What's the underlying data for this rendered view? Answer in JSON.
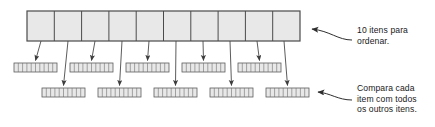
{
  "figure": {
    "title_alt": "Diagrama de ordenacao por comparacao",
    "background_color": "#ffffff",
    "cell_fill": "#e8e8e8",
    "cell_stroke": "#585858",
    "main_bar_stroke": "#404040",
    "arrow_color": "#4a4a4a",
    "text_color": "#1a1a1a"
  },
  "annotations": {
    "top": {
      "lines": [
        "10 itens para",
        "ordenar."
      ],
      "text": "10 itens para ordenar."
    },
    "bottom": {
      "lines": [
        "Compara cada",
        "item com todos",
        "os outros itens."
      ],
      "text": "Compara cada item com todos os outros itens."
    }
  },
  "main_bar": {
    "label": "main-array",
    "cell_count": 10,
    "x": 27,
    "y": 11,
    "width": 273,
    "height": 30
  },
  "middle_row": {
    "label": "comparison-arrays-row-1",
    "bar_count": 5,
    "cells_per_bar": 10,
    "y": 63,
    "height": 9,
    "bar_width": 43,
    "start_x": 14,
    "spacing": 56
  },
  "bottom_row": {
    "label": "comparison-arrays-row-2",
    "bar_count": 5,
    "cells_per_bar": 10,
    "y": 88,
    "height": 9,
    "bar_width": 43,
    "start_x": 42,
    "spacing": 56
  },
  "connectors": {
    "count": 10,
    "description": "setas descendo do vetor principal para os vetores de comparacao"
  },
  "callouts": {
    "top_arrow": "curva apontando para a extremidade direita do vetor principal",
    "bottom_arrow": "curva apontando para o ultimo vetor da linha inferior"
  }
}
